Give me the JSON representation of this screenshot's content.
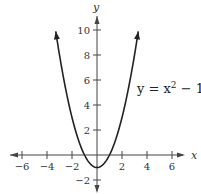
{
  "chart_data": {
    "type": "line",
    "title": "",
    "xlabel": "x",
    "ylabel": "y",
    "xlim": [
      -7,
      7
    ],
    "ylim": [
      -3,
      11
    ],
    "grid": false,
    "x_ticks": [
      -6,
      -4,
      -2,
      2,
      4,
      6
    ],
    "y_ticks": [
      -2,
      2,
      4,
      6,
      8,
      10
    ],
    "x_tick_labels": [
      "−6",
      "−4",
      "−2",
      "2",
      "4",
      "6"
    ],
    "y_tick_labels": [
      "−2",
      "2",
      "4",
      "6",
      "8",
      "10"
    ],
    "series": [
      {
        "name": "y = x^2 - 1",
        "function": "x^2 - 1",
        "x": [
          -3.3,
          -3,
          -2,
          -1,
          0,
          1,
          2,
          3,
          3.3
        ],
        "y": [
          9.89,
          8,
          3,
          0,
          -1,
          0,
          3,
          8,
          9.89
        ],
        "arrows_at_ends": true
      }
    ],
    "annotations": [
      {
        "text": "y = x² − 1",
        "x": 4.2,
        "y": 6
      }
    ]
  },
  "labels": {
    "x_axis": "x",
    "y_axis": "y",
    "equation_main": "y = x",
    "equation_exp": "2",
    "equation_tail": " − 1"
  }
}
